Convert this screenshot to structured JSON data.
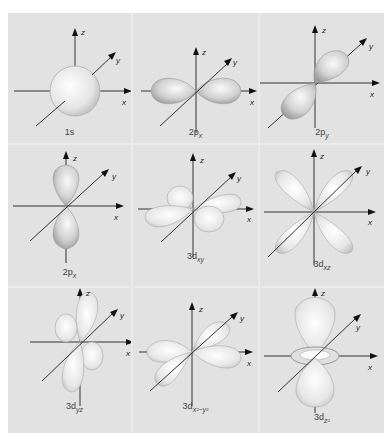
{
  "figure": {
    "title": "",
    "grid": {
      "rows": 3,
      "cols": 3
    },
    "axis_labels": {
      "x": "x",
      "y": "y",
      "z": "z"
    },
    "colors": {
      "background": "#e2e2e2",
      "divider": "#f4f4f4",
      "axis": "#333333",
      "lobe_fill": "#f2f2f2",
      "lobe_shade": "#b8b8b8"
    },
    "panels": [
      {
        "id": "1s",
        "main": "1s",
        "sub": "",
        "shape": "sphere"
      },
      {
        "id": "2px",
        "main": "2p",
        "sub": "x",
        "shape": "dumbbell-x"
      },
      {
        "id": "2py",
        "main": "2p",
        "sub": "y",
        "shape": "dumbbell-y"
      },
      {
        "id": "2pz",
        "main": "2p",
        "sub": "x",
        "shape": "dumbbell-z"
      },
      {
        "id": "3dxy",
        "main": "3d",
        "sub": "xy",
        "shape": "cloverleaf-xy"
      },
      {
        "id": "3dxz",
        "main": "3d",
        "sub": "xz",
        "shape": "cloverleaf-xz"
      },
      {
        "id": "3dyz",
        "main": "3d",
        "sub": "yz",
        "shape": "cloverleaf-yz"
      },
      {
        "id": "3dx2y2",
        "main": "3d",
        "sub": "x²−y²",
        "shape": "cloverleaf-x2y2"
      },
      {
        "id": "3dz2",
        "main": "3d",
        "sub": "z²",
        "shape": "dumbbell-torus"
      }
    ]
  }
}
